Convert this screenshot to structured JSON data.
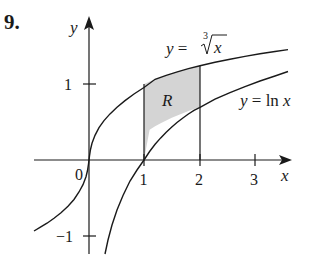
{
  "problem_number": "9.",
  "axes": {
    "x_label": "x",
    "y_label": "y",
    "x_ticks": [
      "1",
      "2",
      "3"
    ],
    "y_ticks": [
      "1",
      "−1"
    ],
    "origin_label": "0"
  },
  "curves": {
    "upper_label_prefix": "y = ",
    "upper_label_index": "3",
    "upper_label_radicand": "x",
    "lower_label": "y = ln x"
  },
  "region": {
    "label": "R",
    "x_from": 1,
    "x_to": 2,
    "fill": "#d4d4d4"
  },
  "colors": {
    "ink": "#1a1a1a",
    "shade": "#d4d4d4"
  }
}
